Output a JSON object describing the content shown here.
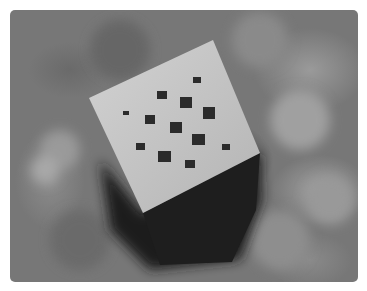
{
  "image": {
    "subject": "3D printed cube with square holes on top face",
    "style": "grayscale photograph",
    "colors": {
      "background": "#777777",
      "cube_top": "#c8c8c8",
      "cube_side": "#1e1e1e",
      "holes": "#2a2a2a",
      "frame": "#ffffff"
    }
  }
}
